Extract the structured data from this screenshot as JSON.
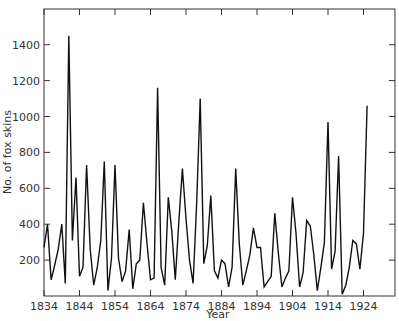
{
  "chart_data": {
    "type": "line",
    "title": "",
    "xlabel": "Year",
    "ylabel": "No. of fox skins",
    "xlim": [
      1834,
      1933
    ],
    "ylim": [
      0,
      1600
    ],
    "grid": false,
    "legend": null,
    "x_ticks": [
      1834,
      1844,
      1854,
      1864,
      1874,
      1884,
      1894,
      1904,
      1914,
      1924
    ],
    "y_ticks": [
      200,
      400,
      600,
      800,
      1000,
      1200,
      1400
    ],
    "x": [
      1834,
      1835,
      1836,
      1837,
      1838,
      1839,
      1840,
      1841,
      1842,
      1843,
      1844,
      1845,
      1846,
      1847,
      1848,
      1849,
      1850,
      1851,
      1852,
      1853,
      1854,
      1855,
      1856,
      1857,
      1858,
      1859,
      1860,
      1861,
      1862,
      1863,
      1864,
      1865,
      1866,
      1867,
      1868,
      1869,
      1870,
      1871,
      1872,
      1873,
      1874,
      1875,
      1876,
      1877,
      1878,
      1879,
      1880,
      1881,
      1882,
      1883,
      1884,
      1885,
      1886,
      1887,
      1888,
      1889,
      1890,
      1891,
      1892,
      1893,
      1894,
      1895,
      1896,
      1897,
      1898,
      1899,
      1900,
      1901,
      1902,
      1903,
      1904,
      1905,
      1906,
      1907,
      1908,
      1909,
      1910,
      1911,
      1912,
      1913,
      1914,
      1915,
      1916,
      1917,
      1918,
      1919,
      1920,
      1921,
      1922,
      1923,
      1924,
      1925
    ],
    "series": [
      {
        "name": "Fox skins",
        "values": [
          270,
          400,
          90,
          170,
          260,
          400,
          70,
          1450,
          310,
          660,
          110,
          160,
          730,
          260,
          60,
          160,
          310,
          750,
          30,
          210,
          730,
          210,
          80,
          140,
          370,
          40,
          180,
          200,
          520,
          300,
          90,
          100,
          1160,
          160,
          60,
          550,
          360,
          90,
          420,
          710,
          430,
          200,
          70,
          520,
          1100,
          180,
          280,
          560,
          140,
          100,
          200,
          180,
          50,
          160,
          710,
          290,
          60,
          140,
          230,
          380,
          270,
          270,
          50,
          80,
          110,
          460,
          240,
          50,
          100,
          140,
          550,
          350,
          50,
          130,
          420,
          390,
          230,
          30,
          160,
          300,
          970,
          150,
          250,
          780,
          10,
          60,
          160,
          310,
          290,
          150,
          350,
          1060
        ]
      }
    ]
  },
  "axes": {
    "x_tick_labels": [
      "1834",
      "1844",
      "1854",
      "1864",
      "1874",
      "1884",
      "1894",
      "1904",
      "1914",
      "1924"
    ],
    "y_tick_labels": [
      "200",
      "400",
      "600",
      "800",
      "1000",
      "1200",
      "1400"
    ],
    "xlabel": "Year",
    "ylabel": "No. of fox skins"
  },
  "colors": {
    "line": "#111111",
    "axis": "#333333"
  }
}
